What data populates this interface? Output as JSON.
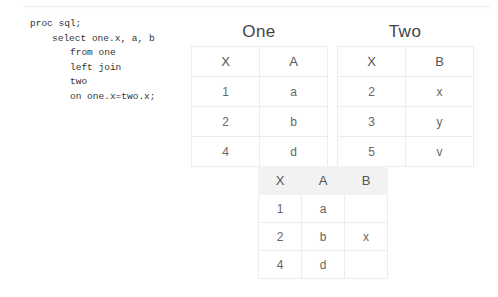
{
  "code": {
    "lines": [
      "proc sql;",
      "select one.x, a, b",
      "from one",
      "left join",
      "two",
      "on one.x=two.x;"
    ]
  },
  "tables": {
    "one": {
      "title": "One",
      "headers": [
        "X",
        "A"
      ],
      "rows": [
        [
          "1",
          "a"
        ],
        [
          "2",
          "b"
        ],
        [
          "4",
          "d"
        ]
      ]
    },
    "two": {
      "title": "Two",
      "headers": [
        "X",
        "B"
      ],
      "rows": [
        [
          "2",
          "x"
        ],
        [
          "3",
          "y"
        ],
        [
          "5",
          "v"
        ]
      ]
    },
    "result": {
      "headers": [
        "X",
        "A",
        "B"
      ],
      "rows": [
        [
          "1",
          "a",
          ""
        ],
        [
          "2",
          "b",
          "x"
        ],
        [
          "4",
          "d",
          ""
        ]
      ]
    }
  },
  "colors": {
    "border": "#ececec",
    "result_header_bg": "#f2f2f2",
    "text": "#555555"
  }
}
